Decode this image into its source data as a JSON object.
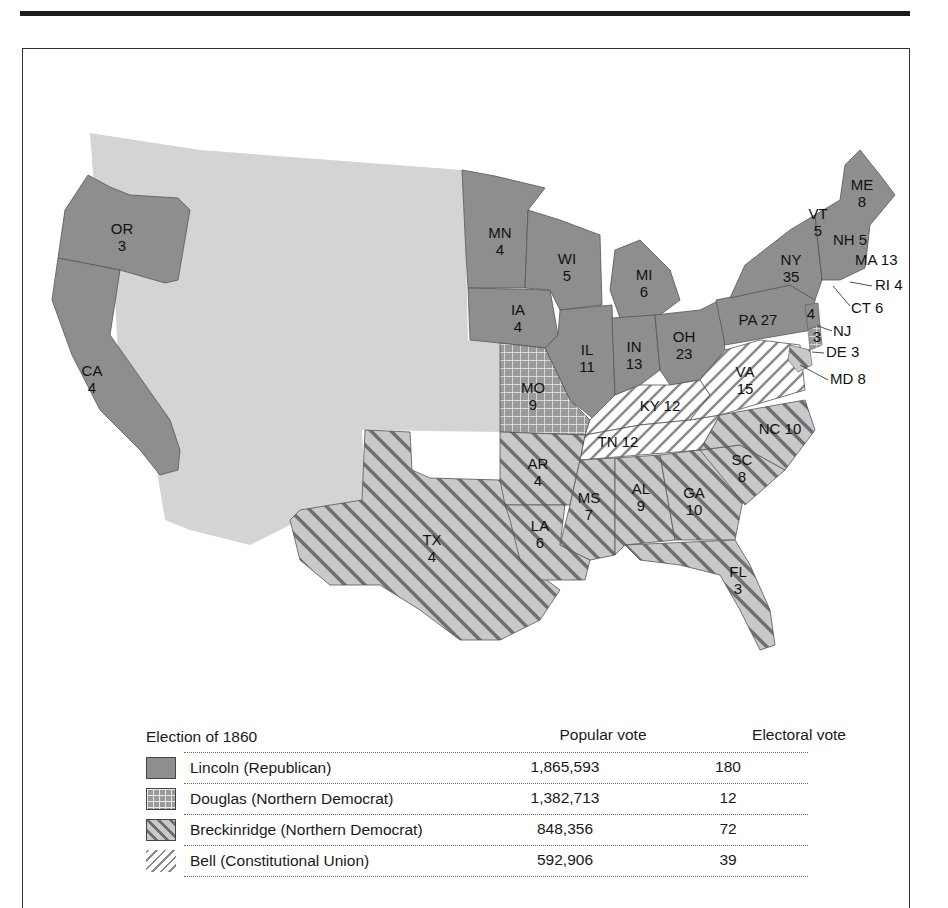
{
  "legend": {
    "title": "Election of 1860",
    "col_popular": "Popular vote",
    "col_electoral": "Electoral vote",
    "rows": [
      {
        "candidate": "Lincoln (Republican)",
        "popular": "1,865,593",
        "electoral": "180",
        "pattern": "solid-dark"
      },
      {
        "candidate": "Douglas (Northern Democrat)",
        "popular": "1,382,713",
        "electoral": "12",
        "pattern": "grid"
      },
      {
        "candidate": "Breckinridge (Northern Democrat)",
        "popular": "848,356",
        "electoral": "72",
        "pattern": "back-diagonal"
      },
      {
        "candidate": "Bell (Constitutional Union)",
        "popular": "592,906",
        "electoral": "39",
        "pattern": "forward-diagonal"
      }
    ]
  },
  "states": {
    "OR": {
      "abbr": "OR",
      "ev": "3"
    },
    "CA": {
      "abbr": "CA",
      "ev": "4"
    },
    "MN": {
      "abbr": "MN",
      "ev": "4"
    },
    "WI": {
      "abbr": "WI",
      "ev": "5"
    },
    "MI": {
      "abbr": "MI",
      "ev": "6"
    },
    "IA": {
      "abbr": "IA",
      "ev": "4"
    },
    "IL": {
      "abbr": "IL",
      "ev": "11"
    },
    "IN": {
      "abbr": "IN",
      "ev": "13"
    },
    "OH": {
      "abbr": "OH",
      "ev": "23"
    },
    "PA": {
      "label": "PA 27"
    },
    "NY": {
      "abbr": "NY",
      "ev": "35"
    },
    "VT": {
      "abbr": "VT",
      "ev": "5"
    },
    "NH": {
      "label": "NH 5"
    },
    "ME": {
      "abbr": "ME",
      "ev": "8"
    },
    "MA": {
      "label": "MA 13"
    },
    "RI": {
      "label": "RI 4"
    },
    "CT": {
      "label": "CT 6"
    },
    "NJ": {
      "label": "NJ",
      "lincoln": "4",
      "douglas": "3"
    },
    "DE": {
      "label": "DE 3"
    },
    "MD": {
      "label": "MD 8"
    },
    "MO": {
      "abbr": "MO",
      "ev": "9"
    },
    "KY": {
      "label": "KY 12"
    },
    "TN": {
      "label": "TN 12"
    },
    "VA": {
      "abbr": "VA",
      "ev": "15"
    },
    "NC": {
      "label": "NC 10"
    },
    "SC": {
      "abbr": "SC",
      "ev": "8"
    },
    "GA": {
      "abbr": "GA",
      "ev": "10"
    },
    "AL": {
      "abbr": "AL",
      "ev": "9"
    },
    "MS": {
      "abbr": "MS",
      "ev": "7"
    },
    "LA": {
      "abbr": "LA",
      "ev": "6"
    },
    "AR": {
      "abbr": "AR",
      "ev": "4"
    },
    "TX": {
      "abbr": "TX",
      "ev": "4"
    },
    "FL": {
      "abbr": "FL",
      "ev": "3"
    }
  },
  "colors": {
    "lincoln": "#8e8e8e",
    "territory": "#d4d4d4",
    "southern_base": "#c9c9c9",
    "stripe": "#6f6f6f",
    "bell_base": "#ffffff",
    "border": "#555555"
  }
}
